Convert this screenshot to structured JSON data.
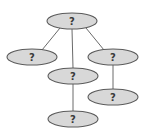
{
  "diagram": {
    "type": "tree",
    "nodes": [
      {
        "id": "root",
        "label": "?",
        "cx": 72,
        "cy": 21
      },
      {
        "id": "left",
        "label": "?",
        "cx": 32,
        "cy": 57
      },
      {
        "id": "middle",
        "label": "?",
        "cx": 73,
        "cy": 76
      },
      {
        "id": "right",
        "label": "?",
        "cx": 113,
        "cy": 57
      },
      {
        "id": "middle-child",
        "label": "?",
        "cx": 73,
        "cy": 119
      },
      {
        "id": "right-child",
        "label": "?",
        "cx": 113,
        "cy": 97
      }
    ],
    "edges": [
      {
        "from": "root",
        "to": "left"
      },
      {
        "from": "root",
        "to": "middle"
      },
      {
        "from": "root",
        "to": "right"
      },
      {
        "from": "middle",
        "to": "middle-child"
      },
      {
        "from": "right",
        "to": "right-child"
      }
    ],
    "colors": {
      "node_fill": "#d8d8d8",
      "node_stroke": "#5a5a5a",
      "edge": "#6a6a6a",
      "label": "#3a3a3a"
    }
  }
}
